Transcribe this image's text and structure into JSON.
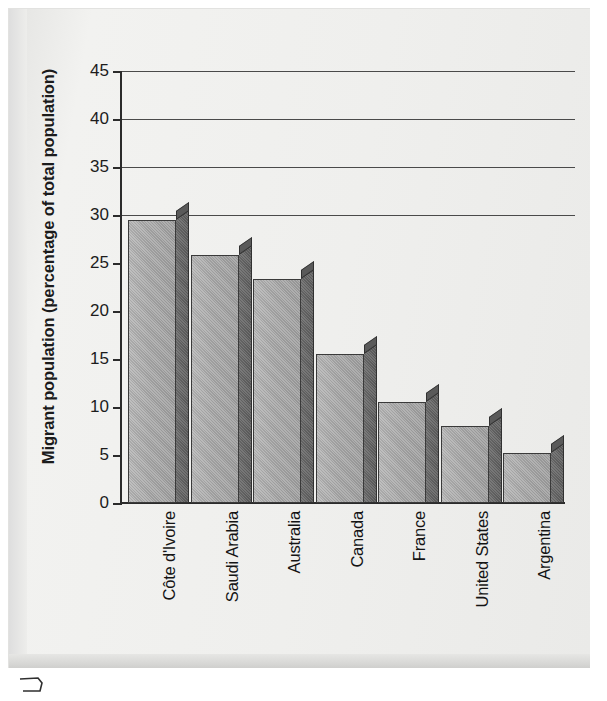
{
  "chart_data": {
    "type": "bar",
    "title": "",
    "xlabel": "",
    "ylabel": "Migrant population (percentage of total population)",
    "ylim": [
      0,
      45
    ],
    "ytick_step": 5,
    "yticks": [
      0,
      5,
      10,
      15,
      20,
      25,
      30,
      35,
      40,
      45
    ],
    "ytick_labels": [
      "0",
      "5",
      "10",
      "15",
      "20",
      "25",
      "30",
      "35",
      "40",
      "45"
    ],
    "gridlines_at": [
      30,
      35,
      40,
      45
    ],
    "grid": true,
    "legend": false,
    "categories": [
      "Côte d'Ivoire",
      "Saudi Arabia",
      "Australia",
      "Canada",
      "France",
      "United States",
      "Argentina"
    ],
    "values": [
      29.5,
      25.8,
      23.3,
      15.5,
      10.5,
      8.0,
      5.2
    ],
    "bar_style": "3d-extruded",
    "colors": {
      "bar_front": "#a6a6a6",
      "bar_side": "#626262",
      "bar_outline": "#313131",
      "axis": "#2b2b2b",
      "gridline": "#4a4a4a",
      "panel_background": "#eeeeec",
      "text": "#141414"
    }
  },
  "axis": {
    "y_title": "Migrant population (percentage of total population)"
  }
}
